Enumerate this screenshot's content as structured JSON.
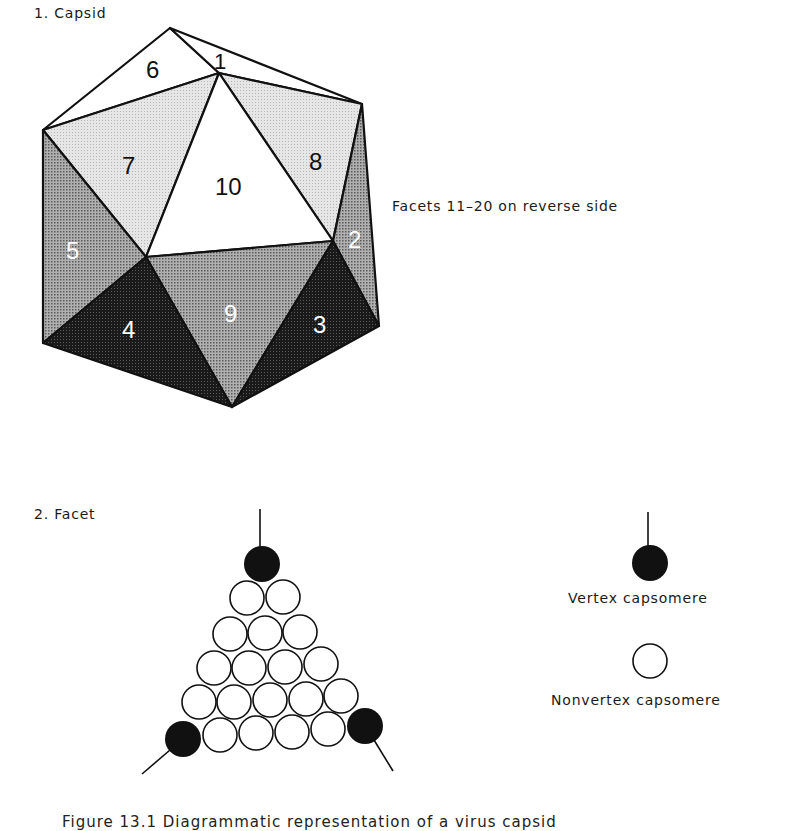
{
  "panel1": {
    "title": "1.  Capsid",
    "note": "Facets 11–20 on reverse side",
    "facets": [
      {
        "id": "1",
        "label": "1",
        "shade": "white"
      },
      {
        "id": "2",
        "label": "2",
        "shade": "medium"
      },
      {
        "id": "3",
        "label": "3",
        "shade": "dark"
      },
      {
        "id": "4",
        "label": "4",
        "shade": "dark"
      },
      {
        "id": "5",
        "label": "5",
        "shade": "medium"
      },
      {
        "id": "6",
        "label": "6",
        "shade": "white"
      },
      {
        "id": "7",
        "label": "7",
        "shade": "light"
      },
      {
        "id": "8",
        "label": "8",
        "shade": "light"
      },
      {
        "id": "9",
        "label": "9",
        "shade": "medium"
      },
      {
        "id": "10",
        "label": "10",
        "shade": "white"
      }
    ]
  },
  "panel2": {
    "title": "2.  Facet",
    "rows": [
      1,
      2,
      3,
      4,
      5,
      6
    ],
    "vertex_count": 3,
    "nonvertex_count": 18
  },
  "legend": {
    "vertex": "Vertex capsomere",
    "nonvertex": "Nonvertex capsomere"
  },
  "caption": "Figure 13.1   Diagrammatic representation of a virus capsid",
  "colors": {
    "line": "#111111",
    "light": "#dcdcdc",
    "medium": "#9a9a9a",
    "dark": "#1e1e1e",
    "white": "#ffffff"
  }
}
